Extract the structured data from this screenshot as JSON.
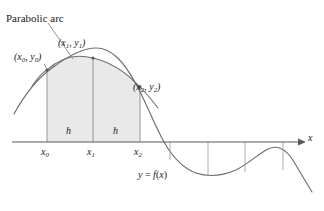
{
  "figure": {
    "title_annotation": "Parabolic arc",
    "axis_label_x": "x",
    "function_label": "y = f(x)",
    "points": [
      {
        "name": "p0",
        "label": "(x0, y0)",
        "x_text": "x",
        "x_sub": "0",
        "y_text": "y",
        "y_sub": "0"
      },
      {
        "name": "p1",
        "label": "(x1, y1)",
        "x_text": "x",
        "x_sub": "1",
        "y_text": "y",
        "y_sub": "1"
      },
      {
        "name": "p2",
        "label": "(x2, y2)",
        "x_text": "x",
        "x_sub": "2",
        "y_text": "y",
        "y_sub": "2"
      }
    ],
    "tick_labels": [
      {
        "base": "x",
        "sub": "0"
      },
      {
        "base": "x",
        "sub": "1"
      },
      {
        "base": "x",
        "sub": "2"
      }
    ],
    "interval_labels": [
      "h",
      "h"
    ],
    "colors": {
      "curve": "#6e6e6e",
      "parabola": "#6e6e6e",
      "axis": "#595959",
      "shade_fill": "#e9e9e9",
      "shade_stroke": "#8a8a8a",
      "tick_line": "#9a9a9a",
      "text": "#1a1a1a"
    },
    "geometry": {
      "axis_y": 142,
      "axis_x_start": 12,
      "axis_x_end": 302,
      "x0": 47,
      "x1": 93,
      "x2": 140,
      "y0": 70,
      "y1": 58,
      "y2": 87,
      "right_ticks": [
        170,
        208,
        245,
        283
      ]
    }
  }
}
